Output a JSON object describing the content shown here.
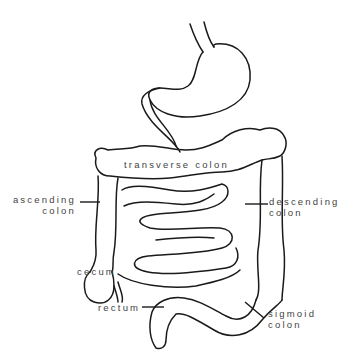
{
  "diagram": {
    "title": "",
    "stroke_color": "#1a1a1a",
    "label_color": "#444444",
    "labels": {
      "transverse_colon": "transverse colon",
      "ascending_colon_line1": "ascending",
      "ascending_colon_line2": "colon",
      "descending_colon_line1": "descending",
      "descending_colon_line2": "colon",
      "cecum": "cecum",
      "rectum": "rectum",
      "sigmoid_colon_line1": "sigmoid",
      "sigmoid_colon_line2": "colon"
    },
    "structures": [
      "esophagus",
      "stomach",
      "duodenum",
      "transverse colon",
      "ascending colon",
      "descending colon",
      "small intestine",
      "cecum",
      "appendix",
      "rectum",
      "sigmoid colon"
    ]
  }
}
